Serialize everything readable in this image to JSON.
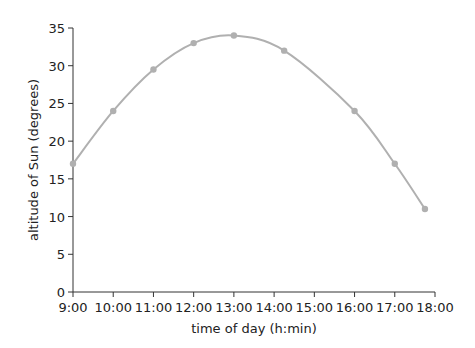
{
  "chart_data": {
    "type": "line",
    "title": "",
    "xlabel": "time of day (h:min)",
    "ylabel": "altitude of Sun (degrees)",
    "x_ticks": [
      "9:00",
      "10:00",
      "11:00",
      "12:00",
      "13:00",
      "14:00",
      "15:00",
      "16:00",
      "17:00",
      "18:00"
    ],
    "y_ticks": [
      0,
      5,
      10,
      15,
      20,
      25,
      30,
      35
    ],
    "xlim": [
      9,
      18
    ],
    "ylim": [
      0,
      35
    ],
    "grid": false,
    "series": [
      {
        "name": "altitude of Sun",
        "color": "#b0b0b0",
        "x": [
          "9:00",
          "10:00",
          "11:00",
          "12:00",
          "13:00",
          "14:15",
          "16:00",
          "17:00",
          "17:45"
        ],
        "x_hours": [
          9,
          10,
          11,
          12,
          13,
          14.25,
          16,
          17,
          17.75
        ],
        "values": [
          17,
          24,
          29.5,
          33,
          34,
          32,
          24,
          17,
          11
        ]
      }
    ]
  }
}
